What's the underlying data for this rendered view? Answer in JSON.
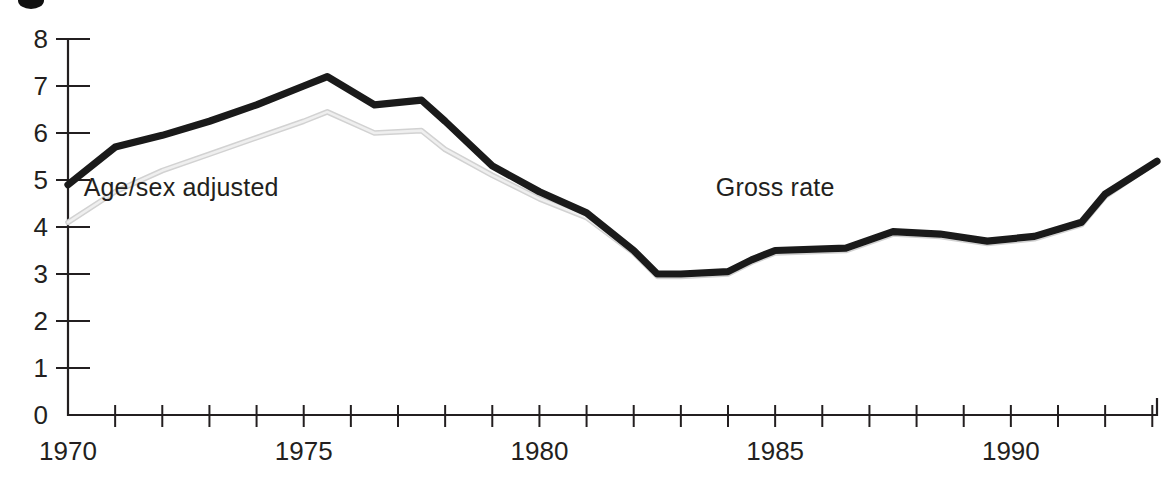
{
  "figure": {
    "bullet_marker": "bullet-dot",
    "background_color": "#ffffff",
    "ink_color": "#231f20"
  },
  "annotations": {
    "adjusted_label": "Age/sex adjusted",
    "gross_label": "Gross rate"
  },
  "axes": {
    "y_ticks": [
      "0",
      "1",
      "2",
      "3",
      "4",
      "5",
      "6",
      "7",
      "8"
    ],
    "x_ticks_labeled": [
      "1970",
      "1975",
      "1980",
      "1985",
      "1990"
    ]
  },
  "chart_data": {
    "type": "line",
    "title": "",
    "subtitle": "",
    "xlabel": "",
    "ylabel": "",
    "xlim": [
      1970,
      1993.1
    ],
    "ylim": [
      0,
      8
    ],
    "grid": false,
    "legend_position": "inline-annotations",
    "x_tick_interval": 1,
    "x_label_interval": 5,
    "y_tick_interval": 1,
    "x": [
      1970,
      1971,
      1972,
      1973,
      1974,
      1975,
      1975.5,
      1976.5,
      1977.5,
      1978,
      1979,
      1980,
      1981,
      1982,
      1982.5,
      1983,
      1984,
      1984.5,
      1985,
      1986.5,
      1987.5,
      1988.5,
      1989.5,
      1990.5,
      1991.5,
      1992,
      1993.1
    ],
    "series": [
      {
        "name": "Gross rate",
        "color": "#1a1a1a",
        "style": "bold-solid",
        "values": [
          4.9,
          5.7,
          5.95,
          6.25,
          6.6,
          7.0,
          7.2,
          6.6,
          6.7,
          6.25,
          5.3,
          4.75,
          4.3,
          3.5,
          3.0,
          3.0,
          3.05,
          3.3,
          3.5,
          3.55,
          3.9,
          3.85,
          3.7,
          3.8,
          4.1,
          4.7,
          5.4
        ]
      },
      {
        "name": "Age/sex adjusted",
        "color": "#d8d8d8",
        "style": "light-solid",
        "values": [
          4.1,
          4.75,
          5.2,
          5.55,
          5.9,
          6.25,
          6.45,
          6.0,
          6.05,
          5.65,
          5.1,
          4.6,
          4.2,
          3.45,
          2.95,
          2.95,
          3.0,
          3.25,
          3.45,
          3.5,
          3.85,
          3.8,
          3.65,
          3.75,
          4.05,
          4.65,
          5.4
        ]
      }
    ],
    "annotations": [
      {
        "text": "Age/sex adjusted",
        "x": 1972.4,
        "y": 4.65
      },
      {
        "text": "Gross rate",
        "x": 1985.0,
        "y": 4.65
      }
    ]
  }
}
